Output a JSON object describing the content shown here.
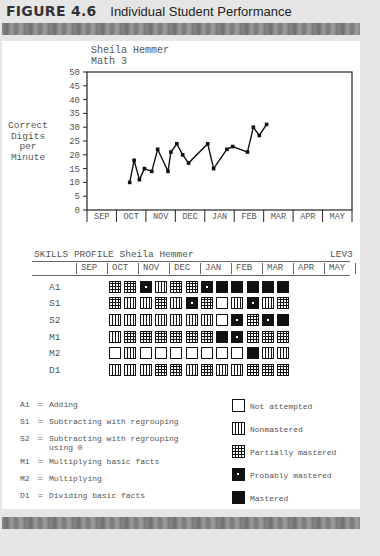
{
  "figure": {
    "number": "FIGURE 4.6",
    "caption": "Individual Student Performance"
  },
  "student": {
    "name": "Sheila Hemmer",
    "subject": "Math 3"
  },
  "chart_data": [
    {
      "type": "line",
      "title": "Sheila Hemmer — Math 3",
      "xlabel": "",
      "ylabel": "Correct Digits per Minute",
      "ylabel_lines": [
        "Correct",
        "Digits",
        "per",
        "Minute"
      ],
      "ylim": [
        0,
        50
      ],
      "yticks": [
        0,
        5,
        10,
        15,
        20,
        25,
        30,
        35,
        40,
        45,
        50
      ],
      "categories": [
        "SEP",
        "OCT",
        "NOV",
        "DEC",
        "JAN",
        "FEB",
        "MAR",
        "APR",
        "MAY"
      ],
      "grid": false,
      "series": [
        {
          "name": "Correct digits per minute",
          "points": [
            {
              "month_pos": 1.45,
              "value": 10
            },
            {
              "month_pos": 1.6,
              "value": 18
            },
            {
              "month_pos": 1.78,
              "value": 11
            },
            {
              "month_pos": 1.95,
              "value": 15
            },
            {
              "month_pos": 2.2,
              "value": 14
            },
            {
              "month_pos": 2.4,
              "value": 22
            },
            {
              "month_pos": 2.75,
              "value": 14
            },
            {
              "month_pos": 2.85,
              "value": 21
            },
            {
              "month_pos": 3.05,
              "value": 24
            },
            {
              "month_pos": 3.25,
              "value": 20
            },
            {
              "month_pos": 3.45,
              "value": 17
            },
            {
              "month_pos": 4.1,
              "value": 24
            },
            {
              "month_pos": 4.3,
              "value": 15
            },
            {
              "month_pos": 4.75,
              "value": 22
            },
            {
              "month_pos": 4.95,
              "value": 23
            },
            {
              "month_pos": 5.45,
              "value": 21
            },
            {
              "month_pos": 5.65,
              "value": 30
            },
            {
              "month_pos": 5.85,
              "value": 27
            },
            {
              "month_pos": 6.1,
              "value": 31
            }
          ]
        }
      ]
    },
    {
      "type": "table",
      "title": "SKILLS PROFILE Sheila Hemmer",
      "level": "LEV3",
      "columns": [
        "SEP",
        "OCT",
        "NOV",
        "DEC",
        "JAN",
        "FEB",
        "MAR",
        "APR",
        "MAY"
      ],
      "rows": [
        {
          "skill": "A1",
          "marks": [
            "partially_mastered",
            "partially_mastered",
            "probably_mastered",
            "nonmastered",
            "partially_mastered",
            "partially_mastered",
            "probably_mastered",
            "mastered",
            "mastered",
            "mastered",
            "mastered",
            "mastered"
          ]
        },
        {
          "skill": "S1",
          "marks": [
            "partially_mastered",
            "nonmastered",
            "nonmastered",
            "partially_mastered",
            "nonmastered",
            "probably_mastered",
            "partially_mastered",
            "not_attempted",
            "nonmastered",
            "probably_mastered",
            "nonmastered",
            "partially_mastered"
          ]
        },
        {
          "skill": "S2",
          "marks": [
            "nonmastered",
            "nonmastered",
            "nonmastered",
            "nonmastered",
            "nonmastered",
            "nonmastered",
            "nonmastered",
            "not_attempted",
            "probably_mastered",
            "partially_mastered",
            "probably_mastered",
            "mastered"
          ]
        },
        {
          "skill": "M1",
          "marks": [
            "nonmastered",
            "partially_mastered",
            "partially_mastered",
            "partially_mastered",
            "partially_mastered",
            "partially_mastered",
            "partially_mastered",
            "mastered",
            "probably_mastered",
            "partially_mastered",
            "partially_mastered",
            "partially_mastered"
          ]
        },
        {
          "skill": "M2",
          "marks": [
            "not_attempted",
            "nonmastered",
            "not_attempted",
            "not_attempted",
            "not_attempted",
            "not_attempted",
            "not_attempted",
            "not_attempted",
            "not_attempted",
            "mastered",
            "nonmastered",
            "nonmastered"
          ]
        },
        {
          "skill": "D1",
          "marks": [
            "nonmastered",
            "nonmastered",
            "nonmastered",
            "partially_mastered",
            "partially_mastered",
            "nonmastered",
            "partially_mastered",
            "nonmastered",
            "nonmastered",
            "partially_mastered",
            "partially_mastered",
            "partially_mastered"
          ]
        }
      ]
    }
  ],
  "skills_profile": {
    "title": "SKILLS PROFILE Sheila Hemmer",
    "level": "LEV3"
  },
  "skill_key": [
    {
      "code": "A1",
      "eq": "=",
      "text": "Adding"
    },
    {
      "code": "S1",
      "eq": "=",
      "text": "Subtracting with regrouping"
    },
    {
      "code": "S2",
      "eq": "=",
      "text": "Subtracting with regrouping\nusing 0"
    },
    {
      "code": "M1",
      "eq": "=",
      "text": "Multiplying basic facts"
    },
    {
      "code": "M2",
      "eq": "=",
      "text": "Multiplying"
    },
    {
      "code": "D1",
      "eq": "=",
      "text": "Dividing basic facts"
    }
  ],
  "mark_legend": [
    {
      "key": "not_attempted",
      "label": "Not attempted"
    },
    {
      "key": "nonmastered",
      "label": "Nonmastered"
    },
    {
      "key": "partially_mastered",
      "label": "Partially mastered"
    },
    {
      "key": "probably_mastered",
      "label": "Probably mastered"
    },
    {
      "key": "mastered",
      "label": "Mastered"
    }
  ],
  "colors": {
    "ink": "#111111",
    "text": "#555555",
    "page_bg": "#e6e6e6",
    "panel_bg": "#ffffff"
  }
}
